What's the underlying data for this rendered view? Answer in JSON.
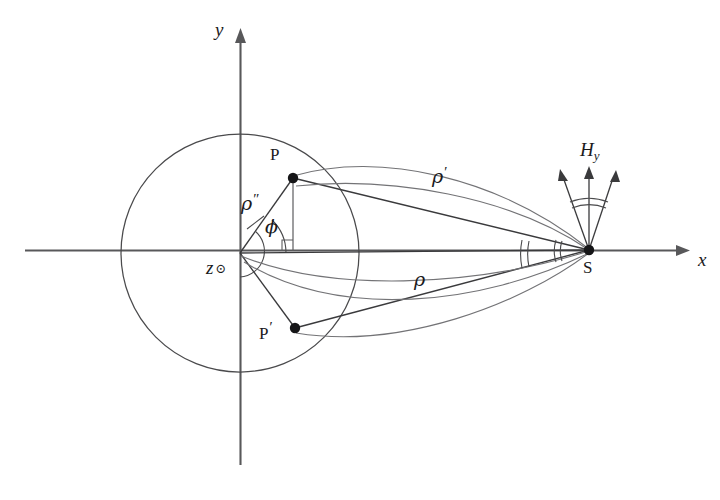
{
  "figure": {
    "background_color": "#ffffff",
    "line_color": "#3a3a3c",
    "curve_color": "#737376",
    "axis_color": "#58585a"
  },
  "axes": {
    "x_label": "x",
    "y_label": "y",
    "origin_symbol": "z",
    "origin_symbol_mark": "⊙",
    "x_start": 25,
    "x_end": 690,
    "y_top": 28,
    "y_bottom": 465,
    "origin_x": 240,
    "origin_y": 253
  },
  "cylinder": {
    "name": "circle-outline",
    "center_x": 240,
    "center_y": 253,
    "radius": 119
  },
  "points": [
    {
      "id": "P",
      "label": "P",
      "x": 293,
      "y": 178,
      "label_x": 270,
      "label_y": 152
    },
    {
      "id": "P_prime",
      "label": "P",
      "prime": "′",
      "x": 295,
      "y": 328,
      "label_x": 262,
      "label_y": 327
    },
    {
      "id": "S",
      "label": "S",
      "x": 589,
      "y": 250,
      "label_x": 585,
      "label_y": 262
    }
  ],
  "labels": {
    "rho_double_prime": {
      "text": "ρ",
      "marks": "″",
      "x": 243,
      "y": 193
    },
    "phi": {
      "text": "ϕ",
      "x": 265,
      "y": 220
    },
    "rho_prime": {
      "text": "ρ",
      "marks": "′",
      "x": 432,
      "y": 164
    },
    "rho": {
      "text": "ρ",
      "x": 414,
      "y": 270
    },
    "H_y": {
      "text": "H",
      "sub": "y",
      "x": 580,
      "y": 141
    }
  },
  "fan": {
    "name": "H-field-arrow-fan",
    "arrow_count": 3,
    "arc_count": 2,
    "apex_x": 589,
    "apex_y": 250
  },
  "angle_markers": {
    "phi_arc": true,
    "right_angle_at_foot": true,
    "source_cone_arcs": 2
  }
}
